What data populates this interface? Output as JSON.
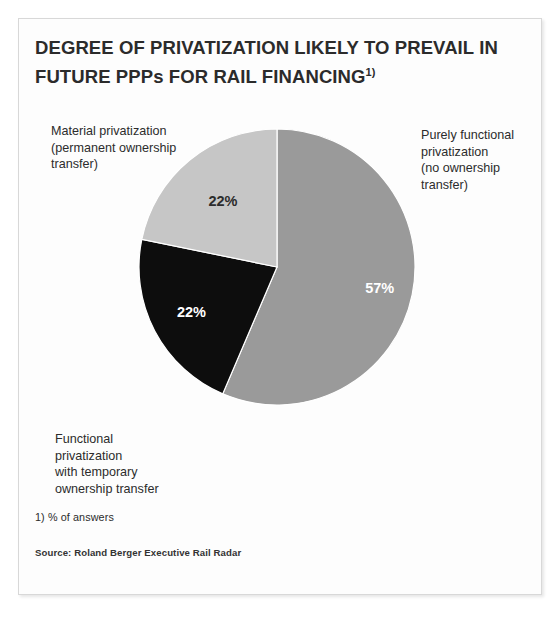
{
  "frame": {
    "border_color": "#d8d8d8",
    "background": "#fdfdfd"
  },
  "title": {
    "line1": "DEGREE OF PRIVATIZATION LIKELY TO PREVAIL IN",
    "line2": "FUTURE PPPs FOR RAIL FINANCING",
    "superscript": "1)"
  },
  "labels": {
    "material": "Material privatization\n(permanent ownership\ntransfer)",
    "purely": "Purely functional\nprivatization\n(no ownership\ntransfer)",
    "functional": "Functional\nprivatization\nwith temporary\nownership transfer"
  },
  "footnote": "1)  % of answers",
  "source": "Source:  Roland Berger Executive Rail Radar",
  "chart_data": {
    "type": "pie",
    "title": "DEGREE OF PRIVATIZATION LIKELY TO PREVAIL IN FUTURE PPPs FOR RAIL FINANCING",
    "unit": "% of answers",
    "start_angle_deg": 0,
    "direction": "clockwise",
    "total": 101,
    "categories": [
      "Purely functional privatization (no ownership transfer)",
      "Functional privatization with temporary ownership transfer",
      "Material privatization (permanent ownership transfer)"
    ],
    "values": [
      57,
      22,
      22
    ],
    "labels": [
      "57%",
      "22%",
      "22%"
    ],
    "colors": [
      "#9a9a9a",
      "#0d0d0d",
      "#c6c6c6"
    ],
    "label_colors": [
      "#ffffff",
      "#ffffff",
      "#2c2c2c"
    ],
    "slices": [
      {
        "name": "purely-functional",
        "category": "Purely functional privatization (no ownership transfer)",
        "value": 57,
        "label": "57%",
        "color": "#9a9a9a",
        "label_color": "#ffffff",
        "label_radius": 0.76
      },
      {
        "name": "functional-temporary",
        "category": "Functional privatization with temporary ownership transfer",
        "value": 22,
        "label": "22%",
        "color": "#0d0d0d",
        "label_color": "#ffffff",
        "label_radius": 0.7
      },
      {
        "name": "material",
        "category": "Material privatization (permanent ownership transfer)",
        "value": 22,
        "label": "22%",
        "color": "#c6c6c6",
        "label_color": "#2c2c2c",
        "label_radius": 0.62
      }
    ],
    "legend": "none",
    "grid": false
  }
}
